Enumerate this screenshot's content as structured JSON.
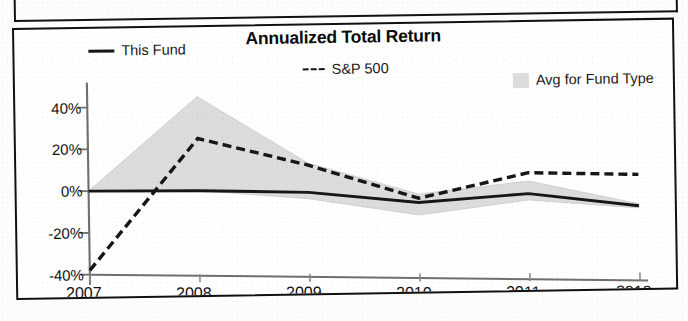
{
  "chart": {
    "title": "Annualized Total Return",
    "ytd_suffix": "YTD",
    "legend": [
      {
        "key": "this-fund",
        "label": "This Fund",
        "marker": "solid-line",
        "color": "#161616"
      },
      {
        "key": "sp-500",
        "label": "S&P 500",
        "marker": "dashed-line",
        "color": "#161616"
      },
      {
        "key": "avg-fund-type",
        "label": "Avg for Fund Type",
        "marker": "area-swatch",
        "color": "#dcdcdc"
      }
    ]
  },
  "chart_data": {
    "type": "line",
    "title": "Annualized Total Return",
    "xlabel": "",
    "ylabel": "",
    "x": [
      "2007",
      "2008",
      "2009",
      "2010",
      "2011",
      "2012"
    ],
    "xtick_labels": [
      "2007",
      "2008",
      "2009",
      "2010",
      "2011",
      "2012"
    ],
    "ytick_labels": [
      "40%",
      "20%",
      "0%",
      "-20%",
      "-40%"
    ],
    "ytick_values": [
      40,
      20,
      0,
      -20,
      -40
    ],
    "ylim": [
      -42,
      48
    ],
    "grid": false,
    "legend_position": "top",
    "series": [
      {
        "name": "This Fund",
        "style": "solid",
        "color": "#161616",
        "values": [
          0,
          0,
          -1,
          -6,
          -2,
          -8
        ]
      },
      {
        "name": "S&P 500",
        "style": "dashed",
        "color": "#161616",
        "values": [
          -38,
          25,
          12,
          -4,
          8,
          7
        ]
      },
      {
        "name": "Avg for Fund Type",
        "style": "band",
        "color": "#dcdcdc",
        "upper": [
          0,
          45,
          13,
          -2,
          4,
          -7
        ],
        "lower": [
          0,
          0,
          -4,
          -12,
          -5,
          -9
        ]
      }
    ]
  }
}
